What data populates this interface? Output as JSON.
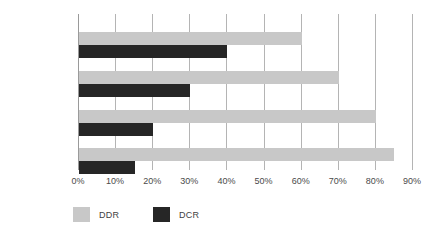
{
  "chart_data": {
    "type": "bar",
    "orientation": "horizontal",
    "title": "",
    "xlabel": "",
    "ylabel": "",
    "categories": [
      "1º mesociclo",
      "2º mesociclo",
      "3º mesociclo",
      "4º mesociclo"
    ],
    "series": [
      {
        "name": "DDR",
        "color": "#c8c8c8",
        "values": [
          60,
          70,
          80,
          85
        ]
      },
      {
        "name": "DCR",
        "color": "#262626",
        "values": [
          40,
          30,
          20,
          15
        ]
      }
    ],
    "xlim": [
      0,
      90
    ],
    "xticks": [
      0,
      10,
      20,
      30,
      40,
      50,
      60,
      70,
      80,
      90
    ],
    "xtick_labels": [
      "0%",
      "10%",
      "20%",
      "30%",
      "40%",
      "50%",
      "60%",
      "70%",
      "80%",
      "90%"
    ],
    "grid": "vertical",
    "legend_position": "bottom-left",
    "value_unit": "%"
  },
  "legend": {
    "items": [
      {
        "label": "DDR",
        "color": "#c8c8c8"
      },
      {
        "label": "DCR",
        "color": "#262626"
      }
    ]
  }
}
